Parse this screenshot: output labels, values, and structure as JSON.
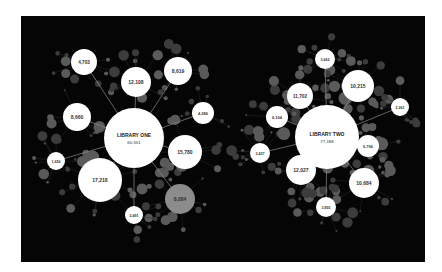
{
  "diagram": {
    "background": "#050505",
    "frame_color": "#ffffff",
    "node_color": "#ffffff",
    "satellite_color": "#5a5a5a",
    "edge_color": "#8a8a8a",
    "clusters": [
      {
        "id": "library-one",
        "label": "LIBRARY ONE",
        "value": "60,551",
        "center": {
          "x": 134,
          "y": 138,
          "r": 30
        },
        "nodes": [
          {
            "value": "4,703",
            "x": 84,
            "y": 62,
            "r": 13
          },
          {
            "value": "12,108",
            "x": 136,
            "y": 82,
            "r": 15
          },
          {
            "value": "8,619",
            "x": 178,
            "y": 71,
            "r": 14
          },
          {
            "value": "4,286",
            "x": 203,
            "y": 113,
            "r": 11
          },
          {
            "value": "15,780",
            "x": 185,
            "y": 152,
            "r": 17
          },
          {
            "value": "8,084",
            "x": 180,
            "y": 199,
            "r": 15,
            "muted": true
          },
          {
            "value": "2,491",
            "x": 134,
            "y": 215,
            "r": 9
          },
          {
            "value": "17,218",
            "x": 100,
            "y": 180,
            "r": 22
          },
          {
            "value": "1,656",
            "x": 56,
            "y": 161,
            "r": 9
          },
          {
            "value": "8,660",
            "x": 77,
            "y": 117,
            "r": 14
          }
        ]
      },
      {
        "id": "library-two",
        "label": "LIBRARY TWO",
        "value": "77,188",
        "center": {
          "x": 327,
          "y": 137,
          "r": 32
        },
        "nodes": [
          {
            "value": "3,662",
            "x": 325,
            "y": 59,
            "r": 10
          },
          {
            "value": "10,215",
            "x": 358,
            "y": 86,
            "r": 16
          },
          {
            "value": "2,261",
            "x": 400,
            "y": 107,
            "r": 9
          },
          {
            "value": "5,796",
            "x": 368,
            "y": 146,
            "r": 11
          },
          {
            "value": "10,684",
            "x": 364,
            "y": 183,
            "r": 15
          },
          {
            "value": "3,855",
            "x": 326,
            "y": 207,
            "r": 10
          },
          {
            "value": "12,027",
            "x": 301,
            "y": 170,
            "r": 15
          },
          {
            "value": "3,437",
            "x": 260,
            "y": 153,
            "r": 10
          },
          {
            "value": "6,104",
            "x": 277,
            "y": 117,
            "r": 11
          },
          {
            "value": "11,702",
            "x": 300,
            "y": 96,
            "r": 13
          }
        ]
      }
    ]
  }
}
